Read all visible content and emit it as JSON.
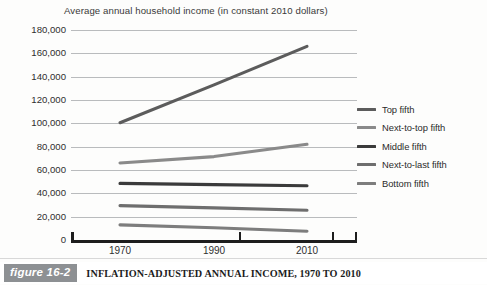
{
  "chart_data": {
    "type": "line",
    "title": "Average annual household income (in constant 2010 dollars)",
    "xlabel": "",
    "ylabel": "",
    "x": [
      1970,
      1990,
      2010
    ],
    "xticklabels": [
      "1970",
      "1990",
      "2010"
    ],
    "ylim": [
      0,
      180000
    ],
    "yticks": [
      0,
      20000,
      40000,
      60000,
      80000,
      100000,
      120000,
      140000,
      160000,
      180000
    ],
    "yticklabels": [
      "0",
      "20,000",
      "40,000",
      "60,000",
      "80,000",
      "100,000",
      "120,000",
      "140,000",
      "160,000",
      "180,000"
    ],
    "grid": "horizontal",
    "legend_position": "right",
    "series": [
      {
        "name": "Top fifth",
        "values": [
          100500,
          133000,
          166000
        ],
        "color": "#5c5c5c"
      },
      {
        "name": "Next-to-top fifth",
        "values": [
          66000,
          71500,
          82000
        ],
        "color": "#8a8a8a"
      },
      {
        "name": "Middle fifth",
        "values": [
          48500,
          47500,
          46500
        ],
        "color": "#3b3b3b"
      },
      {
        "name": "Next-to-last fifth",
        "values": [
          29500,
          27500,
          25500
        ],
        "color": "#6e6e6e"
      },
      {
        "name": "Bottom fifth",
        "values": [
          13000,
          10500,
          7500
        ],
        "color": "#7d7d7d"
      }
    ]
  },
  "caption": {
    "badge": "figure 16-2",
    "text": "INFLATION-ADJUSTED ANNUAL INCOME, 1970 TO 2010"
  },
  "colors": {
    "gridline": "#b9bbbd",
    "axis": "#1d1d1d",
    "badge_background": "#8d9093",
    "page_background": "#fdfdfc"
  }
}
